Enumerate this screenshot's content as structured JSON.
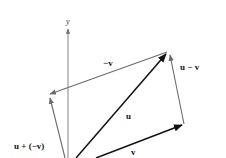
{
  "diagram": {
    "type": "vector-subtraction",
    "axis": {
      "label": "y"
    },
    "vectors": [
      {
        "id": "u",
        "label": "u"
      },
      {
        "id": "v",
        "label": "v"
      },
      {
        "id": "neg_v",
        "label": "−v"
      },
      {
        "id": "u_minus_v",
        "label": "u − v"
      },
      {
        "id": "u_plus_neg_v",
        "label": "u + (−v)"
      }
    ],
    "colors": {
      "primary_vector": "#111111",
      "secondary_vector": "#6b6b6b",
      "axis": "#777777"
    }
  }
}
